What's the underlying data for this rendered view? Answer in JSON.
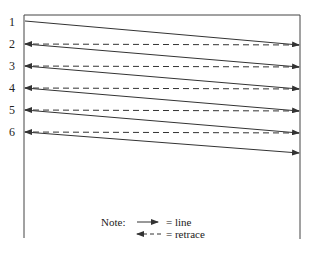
{
  "diagram": {
    "type": "raster-scan",
    "rows": [
      {
        "label": "1",
        "y": 21
      },
      {
        "label": "2",
        "y": 44
      },
      {
        "label": "3",
        "y": 66
      },
      {
        "label": "4",
        "y": 88
      },
      {
        "label": "5",
        "y": 110
      },
      {
        "label": "6",
        "y": 132
      }
    ],
    "final_line_end_y": 153,
    "colors": {
      "stroke": "#333333",
      "background": "#ffffff"
    },
    "legend": {
      "title": "Note:",
      "line_label": "= line",
      "retrace_label": "= retrace"
    }
  }
}
